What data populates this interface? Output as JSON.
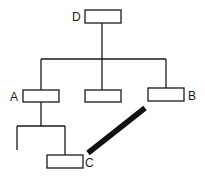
{
  "diagram": {
    "type": "tree",
    "colors": {
      "stroke": "#1a1a1a",
      "background": "#ffffff"
    },
    "nodes": [
      {
        "id": "D",
        "label": "D"
      },
      {
        "id": "A",
        "label": "A"
      },
      {
        "id": "M",
        "label": ""
      },
      {
        "id": "B",
        "label": "B"
      },
      {
        "id": "C",
        "label": "C"
      }
    ],
    "edges": [
      {
        "from": "D",
        "to": "A",
        "style": "thin"
      },
      {
        "from": "D",
        "to": "M",
        "style": "thin"
      },
      {
        "from": "D",
        "to": "B",
        "style": "thin"
      },
      {
        "from": "A",
        "to": "C",
        "style": "thin"
      },
      {
        "from": "A",
        "to": "(unlabeled leaf)",
        "style": "thin"
      },
      {
        "from": "C",
        "to": "B",
        "style": "thick"
      }
    ]
  }
}
